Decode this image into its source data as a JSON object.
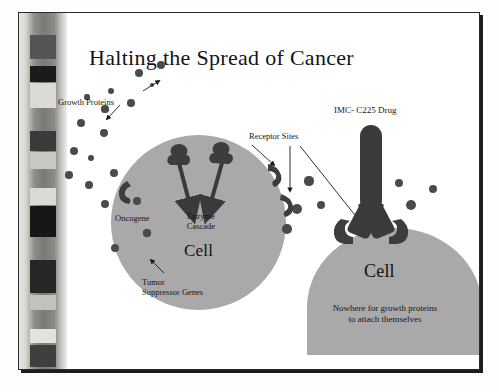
{
  "slide": {
    "title": "Halting the Spread of Cancer",
    "caption_line1": "Nowhere for growth proteins",
    "caption_line2": "to attach themselves",
    "colors": {
      "cell_fill": "#a9a9a9",
      "protein_fill": "#4a4a4a",
      "receptor_fill": "#3d3d3d",
      "drug_fill": "#3a3a3a",
      "text": "#161616",
      "frame_border": "#2b2b2b",
      "background": "#ffffff"
    }
  },
  "left_panel": {
    "cell_label": "Cell",
    "labels": {
      "growth_proteins": "Growth Proteins",
      "oncogene": "Oncogene",
      "enzyme_cascade_line1": "Enzyme",
      "enzyme_cascade_line2": "Cascade",
      "tumor_suppressor_line1": "Tumor",
      "tumor_suppressor_line2": "Suppressor Genes",
      "receptor_sites": "Receptor Sites"
    }
  },
  "right_panel": {
    "cell_label": "Cell",
    "labels": {
      "drug": "IMC- C225 Drug"
    }
  },
  "band": {
    "name": "decorative-striped-band",
    "blocks": [
      {
        "top": 22,
        "height": 24,
        "color": "#545454"
      },
      {
        "top": 53,
        "height": 16,
        "color": "#1b1b1b"
      },
      {
        "top": 70,
        "height": 25,
        "color": "#dcdad4"
      },
      {
        "top": 118,
        "height": 20,
        "color": "#3a3a3a"
      },
      {
        "top": 139,
        "height": 17,
        "color": "#c9c7c1"
      },
      {
        "top": 175,
        "height": 17,
        "color": "#dcdad4"
      },
      {
        "top": 193,
        "height": 31,
        "color": "#171717"
      },
      {
        "top": 247,
        "height": 33,
        "color": "#262626"
      },
      {
        "top": 282,
        "height": 15,
        "color": "#c3c1bb"
      },
      {
        "top": 316,
        "height": 14,
        "color": "#e4e2dc"
      },
      {
        "top": 332,
        "height": 22,
        "color": "#3f3f3f"
      }
    ]
  },
  "left_cell_dots": [
    {
      "cx": 92,
      "cy": 78,
      "r": 3.4
    },
    {
      "cx": 120,
      "cy": 60,
      "r": 4.2
    },
    {
      "cx": 142,
      "cy": 52,
      "r": 4.4
    },
    {
      "cx": 133,
      "cy": 72,
      "r": 2.4
    },
    {
      "cx": 68,
      "cy": 84,
      "r": 2.6
    },
    {
      "cx": 86,
      "cy": 96,
      "r": 3.6
    },
    {
      "cx": 112,
      "cy": 90,
      "r": 3.8
    },
    {
      "cx": 62,
      "cy": 110,
      "r": 4.0
    },
    {
      "cx": 85,
      "cy": 120,
      "r": 4.2
    },
    {
      "cx": 55,
      "cy": 138,
      "r": 4.4
    },
    {
      "cx": 72,
      "cy": 145,
      "r": 3.0
    },
    {
      "cx": 50,
      "cy": 162,
      "r": 3.8
    },
    {
      "cx": 70,
      "cy": 172,
      "r": 4.4
    },
    {
      "cx": 95,
      "cy": 160,
      "r": 4.2
    },
    {
      "cx": 86,
      "cy": 191,
      "r": 4.0
    },
    {
      "cx": 118,
      "cy": 188,
      "r": 4.0
    },
    {
      "cx": 128,
      "cy": 220,
      "r": 4.2
    },
    {
      "cx": 96,
      "cy": 235,
      "r": 4.2
    }
  ],
  "right_cell_dots": [
    {
      "cx": 290,
      "cy": 168,
      "r": 4.6
    },
    {
      "cx": 278,
      "cy": 196,
      "r": 5.0
    },
    {
      "cx": 302,
      "cy": 192,
      "r": 4.2
    },
    {
      "cx": 268,
      "cy": 216,
      "r": 4.8
    },
    {
      "cx": 380,
      "cy": 170,
      "r": 4.4
    },
    {
      "cx": 392,
      "cy": 192,
      "r": 5.0
    },
    {
      "cx": 414,
      "cy": 176,
      "r": 4.0
    },
    {
      "cx": 362,
      "cy": 205,
      "r": 3.6
    }
  ]
}
